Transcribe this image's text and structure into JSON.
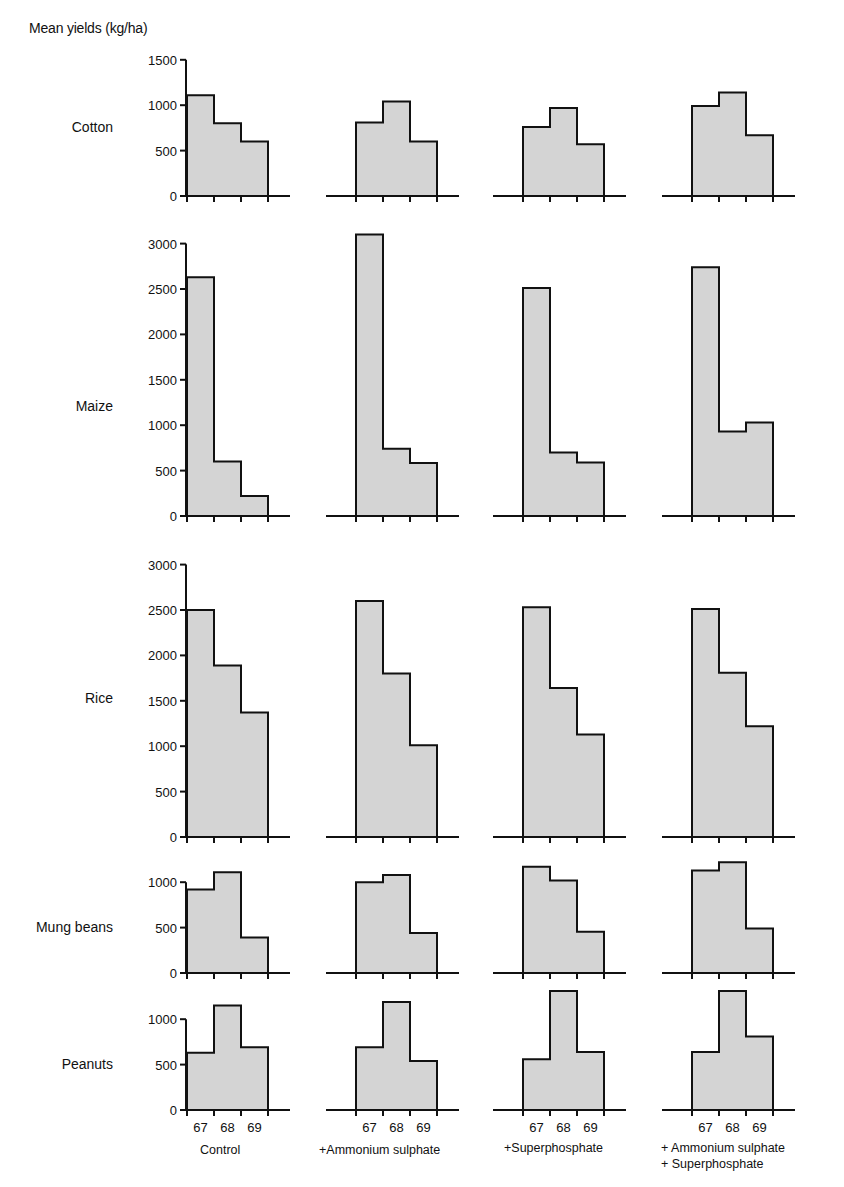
{
  "chart_data": {
    "type": "bar",
    "subtype": "small-multiples step histogram",
    "title": "",
    "ylabel": "Mean yields (kg/ha)",
    "xlabel": "Year",
    "categories": [
      "67",
      "68",
      "69"
    ],
    "treatments": [
      "Control",
      "+Ammonium sulphate",
      "+Superphosphate",
      "+ Ammonium sulphate\n+ Superphosphate"
    ],
    "grid": false,
    "legend": null,
    "panels": [
      {
        "crop": "Cotton",
        "ylim": [
          0,
          1500
        ],
        "yticks": [
          0,
          500,
          1000,
          1500
        ],
        "series": [
          {
            "name": "Control",
            "values": [
              1110,
              800,
              600
            ]
          },
          {
            "name": "+Ammonium sulphate",
            "values": [
              810,
              1040,
              600
            ]
          },
          {
            "name": "+Superphosphate",
            "values": [
              760,
              970,
              570
            ]
          },
          {
            "name": "+ Ammonium sulphate + Superphosphate",
            "values": [
              990,
              1140,
              670
            ]
          }
        ]
      },
      {
        "crop": "Maize",
        "ylim": [
          0,
          3000
        ],
        "yticks": [
          0,
          500,
          1000,
          1500,
          2000,
          2500,
          3000
        ],
        "series": [
          {
            "name": "Control",
            "values": [
              2630,
              600,
              220
            ]
          },
          {
            "name": "+Ammonium sulphate",
            "values": [
              3100,
              740,
              585
            ]
          },
          {
            "name": "+Superphosphate",
            "values": [
              2510,
              700,
              590
            ]
          },
          {
            "name": "+ Ammonium sulphate + Superphosphate",
            "values": [
              2740,
              930,
              1030
            ]
          }
        ]
      },
      {
        "crop": "Rice",
        "ylim": [
          0,
          3000
        ],
        "yticks": [
          0,
          500,
          1000,
          1500,
          2000,
          2500,
          3000
        ],
        "series": [
          {
            "name": "Control",
            "values": [
              2500,
              1890,
              1370
            ]
          },
          {
            "name": "+Ammonium sulphate",
            "values": [
              2600,
              1800,
              1010
            ]
          },
          {
            "name": "+Superphosphate",
            "values": [
              2530,
              1640,
              1130
            ]
          },
          {
            "name": "+ Ammonium sulphate + Superphosphate",
            "values": [
              2510,
              1810,
              1220
            ]
          }
        ]
      },
      {
        "crop": "Mung beans",
        "ylim": [
          0,
          1000
        ],
        "yticks": [
          0,
          500,
          1000
        ],
        "series": [
          {
            "name": "Control",
            "values": [
              920,
              1110,
              390
            ]
          },
          {
            "name": "+Ammonium sulphate",
            "values": [
              1000,
              1080,
              440
            ]
          },
          {
            "name": "+Superphosphate",
            "values": [
              1170,
              1020,
              455
            ]
          },
          {
            "name": "+ Ammonium sulphate + Superphosphate",
            "values": [
              1130,
              1220,
              490
            ]
          }
        ]
      },
      {
        "crop": "Peanuts",
        "ylim": [
          0,
          1000
        ],
        "yticks": [
          0,
          500,
          1000
        ],
        "series": [
          {
            "name": "Control",
            "values": [
              630,
              1150,
              690
            ]
          },
          {
            "name": "+Ammonium sulphate",
            "values": [
              690,
              1190,
              540
            ]
          },
          {
            "name": "+Superphosphate",
            "values": [
              560,
              1310,
              640
            ]
          },
          {
            "name": "+ Ammonium sulphate + Superphosphate",
            "values": [
              640,
              1310,
              810
            ]
          }
        ]
      }
    ]
  },
  "labels": {
    "y_axis_title": "Mean yields (kg/ha)",
    "crops": [
      "Cotton",
      "Maize",
      "Rice",
      "Mung beans",
      "Peanuts"
    ],
    "years": [
      "67",
      "68",
      "69"
    ],
    "treatments": [
      [
        "Control"
      ],
      [
        "+Ammonium sulphate"
      ],
      [
        "+Superphosphate"
      ],
      [
        "+ Ammonium sulphate",
        "+ Superphosphate"
      ]
    ]
  },
  "style": {
    "bar_fill": "#d4d4d4",
    "stroke": "#111111",
    "background": "#ffffff"
  }
}
